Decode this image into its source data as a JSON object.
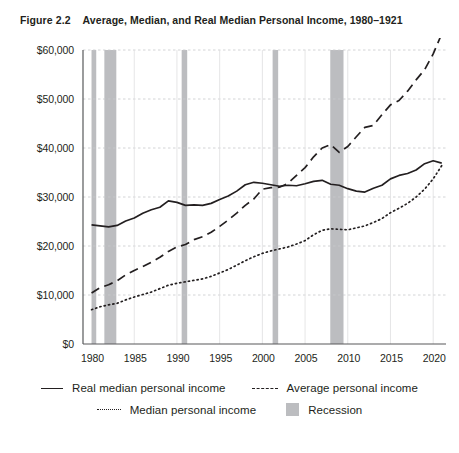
{
  "figure": {
    "number": "Figure 2.2",
    "title": "Average, Median, and Real Median Personal Income, 1980–1921"
  },
  "colors": {
    "ink": "#231f20",
    "recession_band": "#bcbdc0",
    "gridline": "#c8c9cb",
    "axis": "#58595b"
  },
  "legend": {
    "items": [
      {
        "label": "Real median personal income",
        "style": "solid",
        "icon": "solid-line-icon"
      },
      {
        "label": "Average personal income",
        "style": "dashed",
        "icon": "dashed-line-icon"
      },
      {
        "label": "Median personal income",
        "style": "dotted",
        "icon": "dotted-line-icon"
      },
      {
        "label": "Recession",
        "style": "band",
        "icon": "gray-band-icon"
      }
    ]
  },
  "chart_data": {
    "type": "line",
    "title": "Average, Median, and Real Median Personal Income, 1980–1921",
    "xlabel": "",
    "ylabel": "",
    "xlim": [
      1979,
      2021.5
    ],
    "ylim": [
      0,
      60000
    ],
    "grid": true,
    "legend_position": "bottom",
    "ytick_labels": [
      "$0",
      "$10,000",
      "$20,000",
      "$30,000",
      "$40,000",
      "$50,000",
      "$60,000"
    ],
    "ytick_values": [
      0,
      10000,
      20000,
      30000,
      40000,
      50000,
      60000
    ],
    "xtick_labels": [
      "1980",
      "1985",
      "1990",
      "1995",
      "2000",
      "2005",
      "2010",
      "2015",
      "2020"
    ],
    "xtick_values": [
      1980,
      1985,
      1990,
      1995,
      2000,
      2005,
      2010,
      2015,
      2020
    ],
    "x": [
      1980,
      1981,
      1982,
      1983,
      1984,
      1985,
      1986,
      1987,
      1988,
      1989,
      1990,
      1991,
      1992,
      1993,
      1994,
      1995,
      1996,
      1997,
      1998,
      1999,
      2000,
      2001,
      2002,
      2003,
      2004,
      2005,
      2006,
      2007,
      2008,
      2009,
      2010,
      2011,
      2012,
      2013,
      2014,
      2015,
      2016,
      2017,
      2018,
      2019,
      2020,
      2021
    ],
    "series": [
      {
        "name": "Real median personal income",
        "style": "solid",
        "values": [
          24300,
          24100,
          23900,
          24200,
          25100,
          25700,
          26700,
          27400,
          27900,
          29200,
          28900,
          28300,
          28400,
          28300,
          28700,
          29500,
          30200,
          31200,
          32500,
          33000,
          32800,
          32500,
          32200,
          32400,
          32300,
          32700,
          33200,
          33400,
          32600,
          32400,
          31700,
          31200,
          31000,
          31800,
          32400,
          33700,
          34400,
          34800,
          35500,
          36800,
          37400,
          36900
        ]
      },
      {
        "name": "Average personal income",
        "style": "dashed",
        "values": [
          10400,
          11500,
          12100,
          12900,
          14100,
          15000,
          15800,
          16700,
          17700,
          18900,
          19800,
          20300,
          21300,
          21900,
          22800,
          24000,
          25300,
          26700,
          28300,
          29600,
          31600,
          31900,
          32000,
          32800,
          34400,
          36000,
          38200,
          40000,
          40700,
          39100,
          40300,
          42300,
          44200,
          44600,
          46800,
          48800,
          49700,
          51600,
          53900,
          56000,
          59200,
          63300
        ]
      },
      {
        "name": "Median personal income",
        "style": "dotted",
        "values": [
          7000,
          7600,
          8000,
          8300,
          9000,
          9600,
          10100,
          10600,
          11300,
          12000,
          12400,
          12700,
          13000,
          13300,
          13800,
          14500,
          15200,
          16100,
          17000,
          17800,
          18500,
          19000,
          19400,
          19800,
          20400,
          21100,
          22300,
          23200,
          23500,
          23400,
          23300,
          23700,
          24100,
          24800,
          25600,
          26800,
          27700,
          28700,
          30000,
          31600,
          33700,
          36400
        ]
      }
    ],
    "recession_bands": [
      {
        "start": 1980.0,
        "end": 1980.55,
        "label": "1980 recession"
      },
      {
        "start": 1981.5,
        "end": 1982.9,
        "label": "1981–1982 recession"
      },
      {
        "start": 1990.55,
        "end": 1991.2,
        "label": "1990–1991 recession"
      },
      {
        "start": 2001.2,
        "end": 2001.85,
        "label": "2001 recession"
      },
      {
        "start": 2007.95,
        "end": 2009.5,
        "label": "2007–2009 recession"
      }
    ]
  }
}
